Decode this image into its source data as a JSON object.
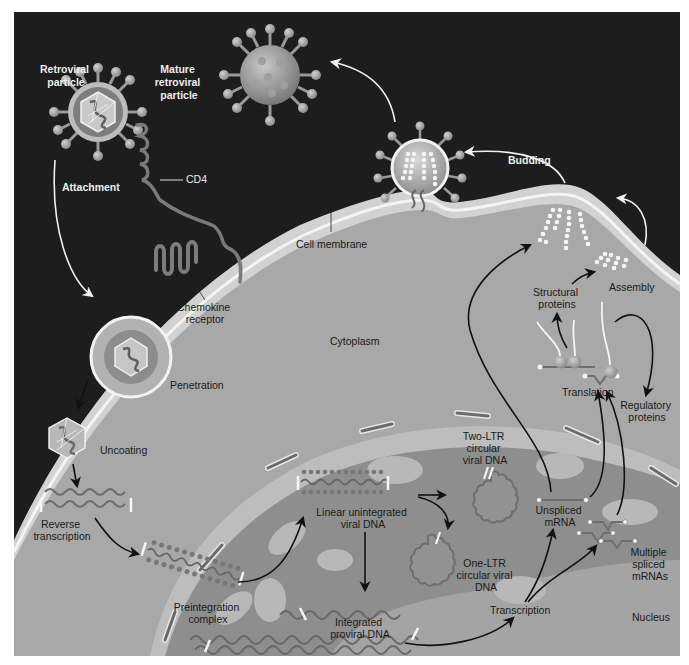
{
  "figure": {
    "colors": {
      "extracellular": "#1c1c1c",
      "membrane": "#d4d4d4",
      "cytoplasm": "#a9a9a9",
      "nucleus": "#8a8a8a",
      "nucleus_light": "#b4b4b4",
      "virion": "#8f8f8f",
      "arrow_dark": "#111111",
      "arrow_light": "#f0f0f0"
    }
  },
  "labels": {
    "retroviral_particle": [
      "Retroviral",
      "particle"
    ],
    "mature_particle": [
      "Mature",
      "retroviral",
      "particle"
    ],
    "attachment": "Attachment",
    "cd4": "CD4",
    "budding": "Budding",
    "cell_membrane": "Cell membrane",
    "chemokine_receptor": [
      "Chemokine",
      "receptor"
    ],
    "cytoplasm": "Cytoplasm",
    "penetration": "Penetration",
    "uncoating": "Uncoating",
    "reverse_transcription": [
      "Reverse",
      "transcription"
    ],
    "preintegration_complex": [
      "Preintegration",
      "complex"
    ],
    "linear_dna": [
      "Linear unintegrated",
      "viral DNA"
    ],
    "two_ltr": [
      "Two-LTR",
      "circular",
      "viral DNA"
    ],
    "one_ltr": [
      "One-LTR",
      "circular viral",
      "DNA"
    ],
    "integrated_dna": [
      "Integrated",
      "proviral DNA"
    ],
    "transcription": "Transcription",
    "unspliced_mrna": [
      "Unspliced",
      "mRNA"
    ],
    "multiple_spliced": [
      "Multiple",
      "spliced",
      "mRNAs"
    ],
    "nucleus": "Nucleus",
    "translation": "Translation",
    "structural_proteins": [
      "Structural",
      "proteins"
    ],
    "regulatory_proteins": [
      "Regulatory",
      "proteins"
    ],
    "assembly": "Assembly"
  }
}
